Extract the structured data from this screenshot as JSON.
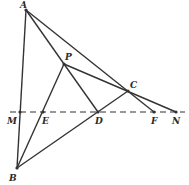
{
  "diagram": {
    "type": "geometry",
    "colors": {
      "line": "#333333",
      "label": "#2a2a2a",
      "background": "#ffffff"
    },
    "points": {
      "A": {
        "label": "A",
        "x": 26,
        "y": 10,
        "lx": 20,
        "ly": 8
      },
      "P": {
        "label": "P",
        "x": 64,
        "y": 64,
        "lx": 65,
        "ly": 60
      },
      "C": {
        "label": "C",
        "x": 128,
        "y": 91,
        "lx": 130,
        "ly": 88
      },
      "M": {
        "label": "M",
        "x": 20,
        "y": 112,
        "lx": 7,
        "ly": 124
      },
      "E": {
        "label": "E",
        "x": 43,
        "y": 112,
        "lx": 42,
        "ly": 124
      },
      "D": {
        "label": "D",
        "x": 98,
        "y": 112,
        "lx": 95,
        "ly": 124
      },
      "F": {
        "label": "F",
        "x": 154,
        "y": 112,
        "lx": 151,
        "ly": 124
      },
      "N": {
        "label": "N",
        "x": 176,
        "y": 112,
        "lx": 172,
        "ly": 124
      },
      "B": {
        "label": "B",
        "x": 17,
        "y": 168,
        "lx": 9,
        "ly": 181
      }
    },
    "segments": [
      [
        "A",
        "B"
      ],
      [
        "A",
        "D"
      ],
      [
        "A",
        "F"
      ],
      [
        "P",
        "N"
      ],
      [
        "B",
        "P"
      ],
      [
        "B",
        "C"
      ],
      [
        "P",
        "D"
      ]
    ],
    "dashed_line": {
      "from": "M",
      "to": "N",
      "x1": 10,
      "x2": 185,
      "y": 112
    }
  }
}
